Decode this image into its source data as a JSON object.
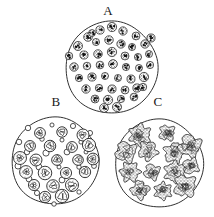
{
  "figure": {
    "type": "scientific-illustration",
    "background_color": "#ffffff",
    "ink_color": "#1a1a1a",
    "width": 214,
    "height": 217,
    "panels": [
      {
        "id": "A",
        "label": "A",
        "label_position": "above-circle",
        "circle": {
          "cx": 111.5,
          "cy": 67.5,
          "r": 46.0
        },
        "cell_type": "small dense stippled round cells",
        "cell_count": 45,
        "cell_radius_px": 4.2,
        "fill_style": "stippled-dark",
        "label_x": 108,
        "label_y": 10
      },
      {
        "id": "B",
        "label": "B",
        "label_position": "above-circle",
        "circle": {
          "cx": 55.0,
          "cy": 161.0,
          "r": 43.5
        },
        "cell_type": "large nucleated ring cells mixed with small empty circles",
        "cell_count": 21,
        "small_circle_count": 22,
        "cell_radius_px": 6.0,
        "small_circle_radius_px": 2.6,
        "fill_style": "ring-with-nucleus",
        "label_x": 55,
        "label_y": 101
      },
      {
        "id": "C",
        "label": "C",
        "label_position": "above-circle",
        "circle": {
          "cx": 159.0,
          "cy": 163.5,
          "r": 44.0
        },
        "cell_type": "large irregular stippled clumps",
        "cell_count": 13,
        "cell_radius_px": 9.5,
        "fill_style": "irregular-stippled-blob",
        "label_x": 158,
        "label_y": 101
      }
    ],
    "panel_a_cells": [
      [
        100,
        30
      ],
      [
        112,
        27
      ],
      [
        123,
        31
      ],
      [
        88,
        37
      ],
      [
        136,
        36
      ],
      [
        78,
        46
      ],
      [
        96,
        42
      ],
      [
        109,
        40
      ],
      [
        121,
        44
      ],
      [
        132,
        47
      ],
      [
        145,
        44
      ],
      [
        151,
        38
      ],
      [
        69,
        56
      ],
      [
        84,
        55
      ],
      [
        98,
        54
      ],
      [
        112,
        52
      ],
      [
        125,
        56
      ],
      [
        138,
        57
      ],
      [
        149,
        54
      ],
      [
        74,
        67
      ],
      [
        87,
        66
      ],
      [
        100,
        65
      ],
      [
        113,
        64
      ],
      [
        126,
        67
      ],
      [
        139,
        68
      ],
      [
        150,
        65
      ],
      [
        79,
        78
      ],
      [
        92,
        77
      ],
      [
        105,
        76
      ],
      [
        118,
        78
      ],
      [
        131,
        79
      ],
      [
        144,
        77
      ],
      [
        86,
        89
      ],
      [
        99,
        88
      ],
      [
        112,
        89
      ],
      [
        125,
        90
      ],
      [
        137,
        88
      ],
      [
        95,
        99
      ],
      [
        108,
        100
      ],
      [
        121,
        99
      ],
      [
        134,
        97
      ],
      [
        104,
        108
      ],
      [
        117,
        107
      ],
      [
        92,
        33
      ],
      [
        143,
        87
      ]
    ],
    "panel_b_big_cells": [
      [
        40,
        133
      ],
      [
        62,
        132
      ],
      [
        83,
        135
      ],
      [
        30,
        146
      ],
      [
        50,
        146
      ],
      [
        72,
        147
      ],
      [
        89,
        145
      ],
      [
        20,
        158
      ],
      [
        36,
        160
      ],
      [
        57,
        160
      ],
      [
        78,
        160
      ],
      [
        93,
        159
      ],
      [
        26,
        172
      ],
      [
        45,
        173
      ],
      [
        66,
        173
      ],
      [
        85,
        172
      ],
      [
        34,
        185
      ],
      [
        53,
        186
      ],
      [
        72,
        185
      ],
      [
        45,
        197
      ],
      [
        62,
        196
      ]
    ],
    "panel_b_small_circles": [
      [
        28,
        128
      ],
      [
        52,
        125
      ],
      [
        73,
        126
      ],
      [
        90,
        133
      ],
      [
        19,
        142
      ],
      [
        42,
        139
      ],
      [
        62,
        140
      ],
      [
        81,
        142
      ],
      [
        27,
        152
      ],
      [
        46,
        153
      ],
      [
        67,
        152
      ],
      [
        86,
        152
      ],
      [
        18,
        166
      ],
      [
        39,
        167
      ],
      [
        59,
        167
      ],
      [
        79,
        167
      ],
      [
        94,
        166
      ],
      [
        29,
        179
      ],
      [
        62,
        180
      ],
      [
        79,
        192
      ],
      [
        37,
        193
      ],
      [
        54,
        204
      ]
    ],
    "panel_c_blobs": [
      [
        140,
        135
      ],
      [
        167,
        133
      ],
      [
        126,
        152
      ],
      [
        148,
        151
      ],
      [
        174,
        153
      ],
      [
        190,
        146
      ],
      [
        130,
        172
      ],
      [
        152,
        172
      ],
      [
        175,
        172
      ],
      [
        191,
        166
      ],
      [
        140,
        190
      ],
      [
        163,
        191
      ],
      [
        185,
        186
      ]
    ]
  }
}
